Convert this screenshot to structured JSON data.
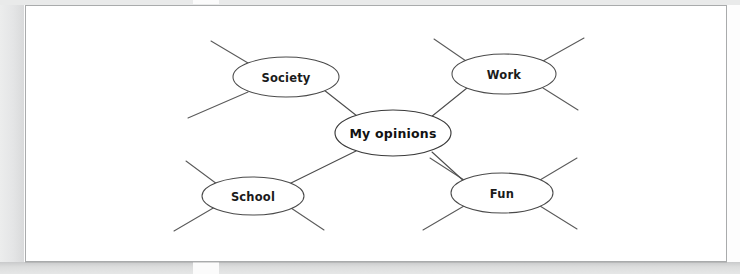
{
  "document": {
    "type": "worksheet-scan",
    "page_background": "#ffffff",
    "scan_margin_color": "#e4e5e6",
    "page_border_color": "#a9abac"
  },
  "diagram": {
    "type": "mind-map",
    "ink_color": "#4d4d4d",
    "center": {
      "id": "my-opinions",
      "label": "My opinions",
      "cx": 367,
      "cy": 127,
      "rx": 58,
      "ry": 23
    },
    "nodes": [
      {
        "id": "society",
        "label": "Society",
        "cx": 260,
        "cy": 71,
        "rx": 53,
        "ry": 20,
        "spokes": [
          {
            "x1": 222,
            "y1": 57,
            "x2": 185,
            "y2": 35
          },
          {
            "x1": 222,
            "y1": 86,
            "x2": 162,
            "y2": 112
          }
        ]
      },
      {
        "id": "work",
        "label": "Work",
        "cx": 478,
        "cy": 68,
        "rx": 52,
        "ry": 20,
        "spokes": [
          {
            "x1": 440,
            "y1": 55,
            "x2": 408,
            "y2": 33
          },
          {
            "x1": 517,
            "y1": 55,
            "x2": 558,
            "y2": 32
          },
          {
            "x1": 517,
            "y1": 82,
            "x2": 552,
            "y2": 104
          }
        ]
      },
      {
        "id": "school",
        "label": "School",
        "cx": 227,
        "cy": 190,
        "rx": 51,
        "ry": 19,
        "spokes": [
          {
            "x1": 191,
            "y1": 178,
            "x2": 160,
            "y2": 155
          },
          {
            "x1": 189,
            "y1": 201,
            "x2": 148,
            "y2": 225
          },
          {
            "x1": 265,
            "y1": 202,
            "x2": 298,
            "y2": 224
          }
        ]
      },
      {
        "id": "fun",
        "label": "Fun",
        "cx": 476,
        "cy": 187,
        "rx": 51,
        "ry": 20,
        "spokes": [
          {
            "x1": 438,
            "y1": 174,
            "x2": 404,
            "y2": 152
          },
          {
            "x1": 438,
            "y1": 200,
            "x2": 397,
            "y2": 224
          },
          {
            "x1": 514,
            "y1": 174,
            "x2": 551,
            "y2": 152
          },
          {
            "x1": 514,
            "y1": 200,
            "x2": 551,
            "y2": 223
          }
        ]
      }
    ],
    "connectors": [
      {
        "from": "society",
        "to": "my-opinions",
        "x1": 298,
        "y1": 84,
        "x2": 331,
        "y2": 110
      },
      {
        "from": "work",
        "to": "my-opinions",
        "x1": 441,
        "y1": 82,
        "x2": 405,
        "y2": 111
      },
      {
        "from": "school",
        "to": "my-opinions",
        "x1": 263,
        "y1": 178,
        "x2": 330,
        "y2": 145
      },
      {
        "from": "fun",
        "to": "my-opinions",
        "x1": 440,
        "y1": 177,
        "x2": 406,
        "y2": 146
      }
    ]
  }
}
